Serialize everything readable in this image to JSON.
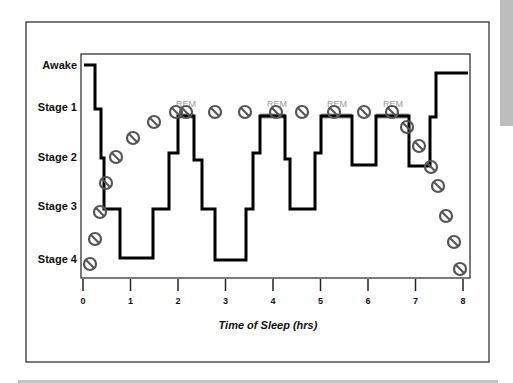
{
  "chart_data": {
    "type": "line",
    "title": "",
    "xlabel": "Time of Sleep (hrs)",
    "ylabel": "",
    "xlim": [
      0,
      8
    ],
    "x_ticks": [
      0,
      1,
      2,
      3,
      4,
      5,
      6,
      7,
      8
    ],
    "y_categories": [
      "Awake",
      "Stage 1",
      "Stage 2",
      "Stage 3",
      "Stage 4"
    ],
    "grid": false,
    "legend": null,
    "annotations": [
      {
        "text": "REM",
        "x": 2.2
      },
      {
        "text": "REM",
        "x": 4.1
      },
      {
        "text": "REM",
        "x": 5.2
      },
      {
        "text": "REM",
        "x": 6.4
      }
    ],
    "series": [
      {
        "name": "Sleep stage (hypnogram)",
        "style": "step",
        "color": "#000000",
        "points_px": [
          [
            84,
            65
          ],
          [
            95,
            65
          ],
          [
            95,
            109
          ],
          [
            101,
            109
          ],
          [
            101,
            158
          ],
          [
            104,
            158
          ],
          [
            104,
            209
          ],
          [
            120,
            209
          ],
          [
            120,
            258
          ],
          [
            153,
            258
          ],
          [
            153,
            209
          ],
          [
            169,
            209
          ],
          [
            169,
            153
          ],
          [
            178,
            153
          ],
          [
            178,
            116
          ],
          [
            194,
            116
          ],
          [
            194,
            160
          ],
          [
            202,
            160
          ],
          [
            202,
            209
          ],
          [
            215,
            209
          ],
          [
            215,
            260
          ],
          [
            246,
            260
          ],
          [
            246,
            209
          ],
          [
            253,
            209
          ],
          [
            253,
            153
          ],
          [
            260,
            153
          ],
          [
            260,
            116
          ],
          [
            285,
            116
          ],
          [
            285,
            159
          ],
          [
            290,
            159
          ],
          [
            290,
            209
          ],
          [
            315,
            209
          ],
          [
            315,
            153
          ],
          [
            321,
            153
          ],
          [
            321,
            116
          ],
          [
            352,
            116
          ],
          [
            352,
            165
          ],
          [
            376,
            165
          ],
          [
            376,
            116
          ],
          [
            409,
            116
          ],
          [
            409,
            166
          ],
          [
            430,
            166
          ],
          [
            430,
            117
          ],
          [
            436,
            117
          ],
          [
            436,
            73
          ],
          [
            468,
            73
          ]
        ],
        "approx_values": [
          {
            "t": 0.0,
            "stage": "Awake"
          },
          {
            "t": 0.25,
            "stage": "Stage 1"
          },
          {
            "t": 0.4,
            "stage": "Stage 2"
          },
          {
            "t": 0.45,
            "stage": "Stage 3"
          },
          {
            "t": 0.8,
            "stage": "Stage 4"
          },
          {
            "t": 1.5,
            "stage": "Stage 3"
          },
          {
            "t": 1.8,
            "stage": "Stage 2"
          },
          {
            "t": 2.0,
            "stage": "REM"
          },
          {
            "t": 2.35,
            "stage": "Stage 2"
          },
          {
            "t": 2.5,
            "stage": "Stage 3"
          },
          {
            "t": 2.8,
            "stage": "Stage 4"
          },
          {
            "t": 3.45,
            "stage": "Stage 3"
          },
          {
            "t": 3.6,
            "stage": "Stage 2"
          },
          {
            "t": 3.75,
            "stage": "REM"
          },
          {
            "t": 4.25,
            "stage": "Stage 2"
          },
          {
            "t": 4.35,
            "stage": "Stage 3"
          },
          {
            "t": 4.9,
            "stage": "Stage 2"
          },
          {
            "t": 5.0,
            "stage": "REM"
          },
          {
            "t": 5.65,
            "stage": "Stage 2"
          },
          {
            "t": 6.15,
            "stage": "REM"
          },
          {
            "t": 6.85,
            "stage": "Stage 2"
          },
          {
            "t": 7.3,
            "stage": "Stage 1"
          },
          {
            "t": 7.45,
            "stage": "Awake"
          }
        ]
      },
      {
        "name": "Circle markers (slashed)",
        "style": "markers",
        "color": "#555555",
        "points_px": [
          [
            90,
            264
          ],
          [
            95,
            239
          ],
          [
            100,
            212
          ],
          [
            106,
            183
          ],
          [
            116,
            157
          ],
          [
            133,
            138
          ],
          [
            154,
            122
          ],
          [
            176,
            112
          ],
          [
            186,
            112
          ],
          [
            215,
            112
          ],
          [
            245,
            112
          ],
          [
            276,
            112
          ],
          [
            302,
            112
          ],
          [
            334,
            112
          ],
          [
            364,
            112
          ],
          [
            392,
            112
          ],
          [
            407,
            127
          ],
          [
            419,
            146
          ],
          [
            431,
            167
          ],
          [
            438,
            186
          ],
          [
            446,
            216
          ],
          [
            454,
            242
          ],
          [
            460,
            269
          ]
        ]
      },
      {
        "name": "REM segments",
        "style": "highlight",
        "color": "#9e9e9e",
        "segments_px": [
          [
            178,
            194,
            116
          ],
          [
            260,
            285,
            116
          ],
          [
            321,
            352,
            116
          ],
          [
            376,
            409,
            116
          ]
        ]
      }
    ]
  },
  "labels": {
    "y": [
      "Awake",
      "Stage 1",
      "Stage 2",
      "Stage 3",
      "Stage 4"
    ],
    "x": [
      "0",
      "1",
      "2",
      "3",
      "4",
      "5",
      "6",
      "7",
      "8"
    ],
    "xlabel": "Time of Sleep (hrs)",
    "rem": [
      "REM",
      "REM",
      "REM",
      "REM"
    ]
  }
}
